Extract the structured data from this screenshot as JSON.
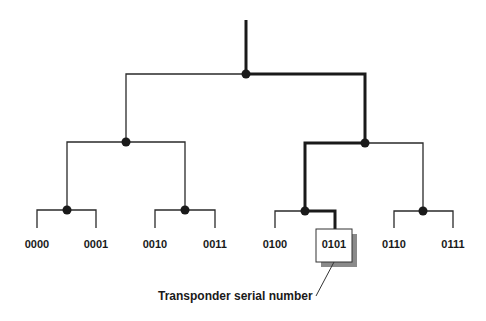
{
  "diagram": {
    "type": "binary-tree",
    "highlighted_leaf": "0101",
    "highlighted_path": [
      "root",
      "1",
      "10",
      "0101"
    ],
    "leaves": [
      {
        "id": "0000",
        "label": "0000"
      },
      {
        "id": "0001",
        "label": "0001"
      },
      {
        "id": "0010",
        "label": "0010"
      },
      {
        "id": "0011",
        "label": "0011"
      },
      {
        "id": "0100",
        "label": "0100"
      },
      {
        "id": "0101",
        "label": "0101"
      },
      {
        "id": "0110",
        "label": "0110"
      },
      {
        "id": "0111",
        "label": "0111"
      }
    ],
    "annotation": {
      "text": "Transponder serial number",
      "target": "0101"
    }
  }
}
